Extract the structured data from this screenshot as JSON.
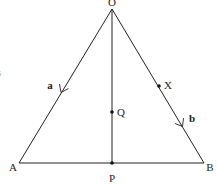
{
  "diagram": {
    "points": {
      "O": {
        "label": "O",
        "x": 112,
        "y": 9
      },
      "A": {
        "label": "A",
        "x": 19,
        "y": 163
      },
      "B": {
        "label": "B",
        "x": 204,
        "y": 163
      },
      "P": {
        "label": "P",
        "x": 112,
        "y": 163
      },
      "Q": {
        "label": "Q",
        "x": 112,
        "y": 112
      },
      "X": {
        "label": "X",
        "x": 159,
        "y": 86
      }
    },
    "vectors": {
      "a": {
        "label": "a",
        "from": "O",
        "to": "A"
      },
      "b": {
        "label": "b",
        "from": "O",
        "to": "B"
      }
    },
    "segments": [
      "OA",
      "OB",
      "AB",
      "OP"
    ],
    "marked_points": [
      "Q",
      "X",
      "P"
    ],
    "edge_fragment": "s",
    "colors": {
      "line": "#222222",
      "text": "#222222",
      "background": "#ffffff"
    }
  }
}
